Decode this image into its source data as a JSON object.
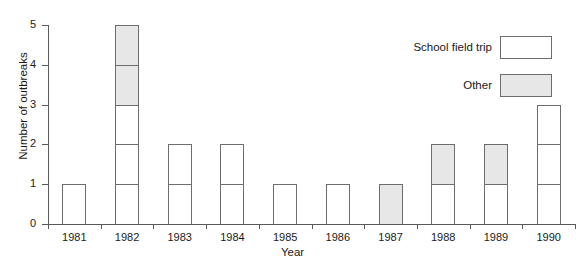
{
  "chart_data": {
    "type": "bar",
    "subtype": "stacked-bar",
    "title": "",
    "xlabel": "Year",
    "ylabel": "Number of outbreaks",
    "categories": [
      "1981",
      "1982",
      "1983",
      "1984",
      "1985",
      "1986",
      "1987",
      "1988",
      "1989",
      "1990"
    ],
    "series": [
      {
        "name": "School field trip",
        "color": "#ffffff",
        "values": [
          1,
          3,
          2,
          2,
          1,
          1,
          0,
          1,
          1,
          3
        ]
      },
      {
        "name": "Other",
        "color": "#e7e7e7",
        "values": [
          0,
          2,
          0,
          0,
          0,
          0,
          1,
          1,
          1,
          0
        ]
      }
    ],
    "totals": [
      1,
      5,
      2,
      2,
      1,
      1,
      1,
      2,
      2,
      3
    ],
    "ylim": [
      0,
      5
    ],
    "yticks": [
      0,
      1,
      2,
      3,
      4,
      5
    ],
    "ytick_labels": [
      "0",
      "1",
      "2",
      "3",
      "4",
      "5"
    ],
    "grid": false,
    "legend_position": "top-right",
    "stack_unit_outlines": true
  },
  "axes": {
    "y_title": "Number of outbreaks",
    "x_title": "Year"
  },
  "legend": {
    "entries": [
      {
        "label": "School field trip",
        "swatch": "white"
      },
      {
        "label": "Other",
        "swatch": "gray"
      }
    ]
  },
  "colors": {
    "axis": "#5a5a5a",
    "bar_outline": "#6d6d6d",
    "school_fill": "#ffffff",
    "other_fill": "#e7e7e7",
    "text": "#1a1a1a",
    "background": "#ffffff"
  }
}
